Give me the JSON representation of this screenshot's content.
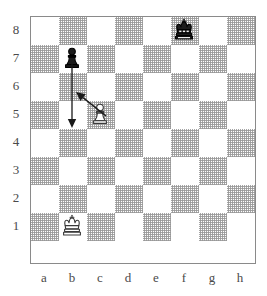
{
  "board": {
    "files": [
      "a",
      "b",
      "c",
      "d",
      "e",
      "f",
      "g",
      "h"
    ],
    "ranks": [
      "8",
      "7",
      "6",
      "5",
      "4",
      "3",
      "2",
      "1"
    ],
    "square_size": 28,
    "light_color": "#ffffff",
    "dark_color": "#969696",
    "border_color": "#8a8a8a",
    "label_color": "#4a4a4a",
    "orientation": "white-bottom"
  },
  "pieces": [
    {
      "id": "black-king-f8",
      "name": "black-king",
      "color": "black",
      "type": "king",
      "square": "f8",
      "file": 5,
      "rank": 0
    },
    {
      "id": "black-pawn-b7",
      "name": "black-pawn",
      "color": "black",
      "type": "pawn",
      "square": "b7",
      "file": 1,
      "rank": 1
    },
    {
      "id": "white-pawn-c5",
      "name": "white-pawn",
      "color": "white",
      "type": "pawn",
      "square": "c5",
      "file": 2,
      "rank": 3
    },
    {
      "id": "white-king-b1",
      "name": "white-king",
      "color": "white",
      "type": "king",
      "square": "b1",
      "file": 1,
      "rank": 7
    }
  ],
  "arrows": [
    {
      "id": "arrow-b7-b5",
      "name": "pawn-advance-arrow",
      "from_square": "b7",
      "to_square": "b5",
      "x1": 42,
      "y1": 48,
      "x2": 42,
      "y2": 112,
      "color": "#1a1a1a",
      "head": "at-end"
    },
    {
      "id": "arrow-c5-b6",
      "name": "pawn-capture-arrow",
      "from_square": "c5",
      "to_square": "b6",
      "x1": 76,
      "y1": 100,
      "x2": 46,
      "y2": 76,
      "color": "#1a1a1a",
      "head": "at-end"
    }
  ],
  "fen": "5k2/1p6/8/2P5/8/8/8/1K6"
}
